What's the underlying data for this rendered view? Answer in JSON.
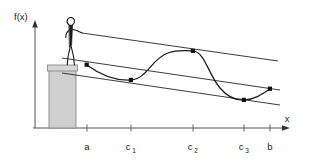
{
  "figure": {
    "kind": "mean-value-theorem-illustration",
    "background_color": "#ffffff",
    "ink_color": "#1a1a1a",
    "pedestal_fill": "#cfcfcf",
    "pedestal_stroke": "#6b6b6b",
    "axes": {
      "y_axis_label": "f(x)",
      "x_axis_label": "x",
      "y_axis_x": 35,
      "y_axis_top": 22,
      "x_axis_y": 128,
      "x_axis_right": 288
    },
    "x_ticks": [
      {
        "label": "a",
        "sub": "",
        "x": 87
      },
      {
        "label": "c",
        "sub": "1",
        "x": 131
      },
      {
        "label": "c",
        "sub": "2",
        "x": 193
      },
      {
        "label": "c",
        "sub": "3",
        "x": 244
      },
      {
        "label": "b",
        "sub": "",
        "x": 270
      }
    ],
    "curve_points": [
      {
        "name": "point-a",
        "x": 87,
        "y": 65
      },
      {
        "name": "point-c1",
        "x": 131,
        "y": 80
      },
      {
        "name": "point-c2",
        "x": 193,
        "y": 51
      },
      {
        "name": "point-c3",
        "x": 244,
        "y": 100
      },
      {
        "name": "point-b",
        "x": 270,
        "y": 89
      }
    ],
    "lines": [
      {
        "name": "upper-tangent-line",
        "role": "tangent at c2",
        "x1": 72,
        "y1": 33,
        "x2": 278,
        "y2": 62
      },
      {
        "name": "secant-line",
        "role": "secant through a and b",
        "x1": 62,
        "y1": 58,
        "x2": 280,
        "y2": 90
      },
      {
        "name": "lower-tangent-line",
        "role": "tangent at c1 and c3",
        "x1": 62,
        "y1": 73,
        "x2": 280,
        "y2": 105
      }
    ],
    "pedestal": {
      "x": 49,
      "y": 65,
      "width": 27,
      "height": 63,
      "cap_y": 65,
      "cap_height": 5
    },
    "stick_figure": {
      "name": "stick-figure-person",
      "head_cx": 70,
      "head_cy": 22,
      "body_top_y": 27,
      "feet_y": 65
    }
  }
}
